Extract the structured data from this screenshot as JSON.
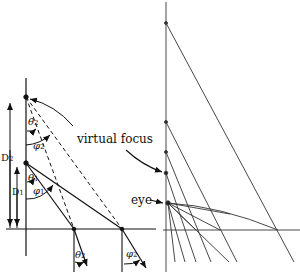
{
  "figure": {
    "type": "optics ray diagram",
    "labels": {
      "virtual_focus": "virtual focus",
      "eye": "eye",
      "D2": "D",
      "D2_sub": "2",
      "D1": "D",
      "D1_sub": "1",
      "theta1": "θ",
      "theta1_sub": "1",
      "theta2": "θ",
      "theta2_sub": "2",
      "phi1": "φ",
      "phi1_sub": "1",
      "phi2": "φ",
      "phi2_sub": "2",
      "theta2_bottom": "θ",
      "theta2_bottom_sub": "2",
      "phi2_bottom": "φ",
      "phi2_bottom_sub": "2"
    },
    "colors": {
      "ink": "#111111",
      "light_ink": "#555555",
      "background": "#ffffff"
    },
    "left_panel": {
      "axis_x": 26,
      "baseline_y": 229,
      "virtual_focus_point": [
        26,
        97
      ],
      "source_point": [
        26,
        163
      ],
      "ground_points": [
        [
          74,
          229
        ],
        [
          122,
          229
        ]
      ]
    },
    "right_panel": {
      "axis_x": 166,
      "baseline_y": 230,
      "eye_point": [
        168,
        203
      ],
      "focus_points_y": [
        23,
        122,
        152,
        173
      ]
    }
  }
}
